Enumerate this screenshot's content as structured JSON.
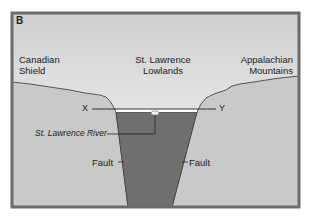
{
  "panel_label": "B",
  "regions": {
    "left": {
      "line1": "Canadian",
      "line2": "Shield"
    },
    "center": {
      "line1": "St. Lawrence",
      "line2": "Lowlands"
    },
    "right": {
      "line1": "Appalachian",
      "line2": "Mountains"
    }
  },
  "section_line": {
    "start": "X",
    "end": "Y"
  },
  "river_label": "St. Lawrence River",
  "fault_left": "Fault",
  "fault_right": "Fault",
  "colors": {
    "border": "#6b6b6b",
    "sky_top": "#d2d2d2",
    "sky_bottom": "#f4f4f4",
    "ground": "#c8c8c8",
    "graben": "#707070",
    "outline": "#333333"
  }
}
